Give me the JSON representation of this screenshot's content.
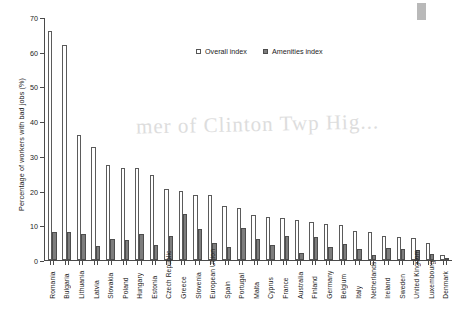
{
  "chart_data": {
    "type": "bar",
    "title": "",
    "xlabel": "",
    "ylabel": "Percentage of workers with bad jobs (%)",
    "ylim": [
      0,
      70
    ],
    "yticks": [
      0,
      10,
      20,
      30,
      40,
      50,
      60,
      70
    ],
    "grid": false,
    "legend_position": "top-center",
    "categories": [
      "Romania",
      "Bulgaria",
      "Lithuania",
      "Latvia",
      "Slovakia",
      "Poland",
      "Hungary",
      "Estonia",
      "Czech Republic",
      "Greece",
      "Slovenia",
      "European Union",
      "Spain",
      "Portugal",
      "Malta",
      "Cyprus",
      "France",
      "Australia",
      "Finland",
      "Germany",
      "Belgium",
      "Italy",
      "Netherlands",
      "Ireland",
      "Sweden",
      "United Kingdom",
      "Luxembourg",
      "Denmark"
    ],
    "series": [
      {
        "name": "Overall index",
        "values": [
          66,
          62,
          36,
          32.5,
          27.5,
          26.5,
          26.5,
          24.5,
          20.5,
          20,
          18.8,
          18.6,
          15.5,
          15,
          13,
          12.5,
          12.2,
          11.5,
          11,
          10.5,
          10,
          8.5,
          8,
          7,
          6.5,
          6.2,
          5,
          1.5
        ]
      },
      {
        "name": "Amenities index",
        "values": [
          8.2,
          8,
          7.5,
          4,
          6,
          5.8,
          7.4,
          4.4,
          7,
          13.2,
          8.8,
          4.8,
          3.8,
          9.2,
          6,
          4.2,
          6.8,
          2,
          6.5,
          3.8,
          4.5,
          3.2,
          1.4,
          3.5,
          3.2,
          3,
          1.6,
          0.6
        ]
      }
    ]
  },
  "legend": {
    "items": [
      {
        "label": "Overall index",
        "marker": "open-square",
        "color": "#ffffff"
      },
      {
        "label": "Amenities index",
        "marker": "filled-square",
        "color": "#7d7d7d"
      }
    ]
  },
  "artifacts": {
    "watermark_text": "mer of Clinton Twp Hig..."
  }
}
